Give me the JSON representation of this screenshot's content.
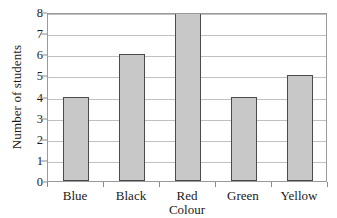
{
  "chart_data": {
    "type": "bar",
    "title": "",
    "xlabel": "Colour",
    "ylabel": "Number of students",
    "categories": [
      "Blue",
      "Black",
      "Red",
      "Green",
      "Yellow"
    ],
    "values": [
      4,
      6,
      8,
      4,
      5
    ],
    "ylim": [
      0,
      8
    ],
    "ytick_labels": [
      "0",
      "1",
      "2",
      "3",
      "4",
      "5",
      "6",
      "7",
      "8"
    ],
    "ytick_values": [
      0,
      1,
      2,
      3,
      4,
      5,
      6,
      7,
      8
    ],
    "grid": "horizontal",
    "legend": "none",
    "series": [
      {
        "name": "Number of students",
        "values": [
          4,
          6,
          8,
          4,
          5
        ]
      }
    ],
    "colors": {
      "bar_fill": "#c8c8c8",
      "bar_border": "#4a4a4a",
      "gridline": "#c0c0c0",
      "axis": "#8a8a8a",
      "frame": "#9a9a9a",
      "text": "#1a1a1a",
      "background": "#ffffff"
    }
  }
}
